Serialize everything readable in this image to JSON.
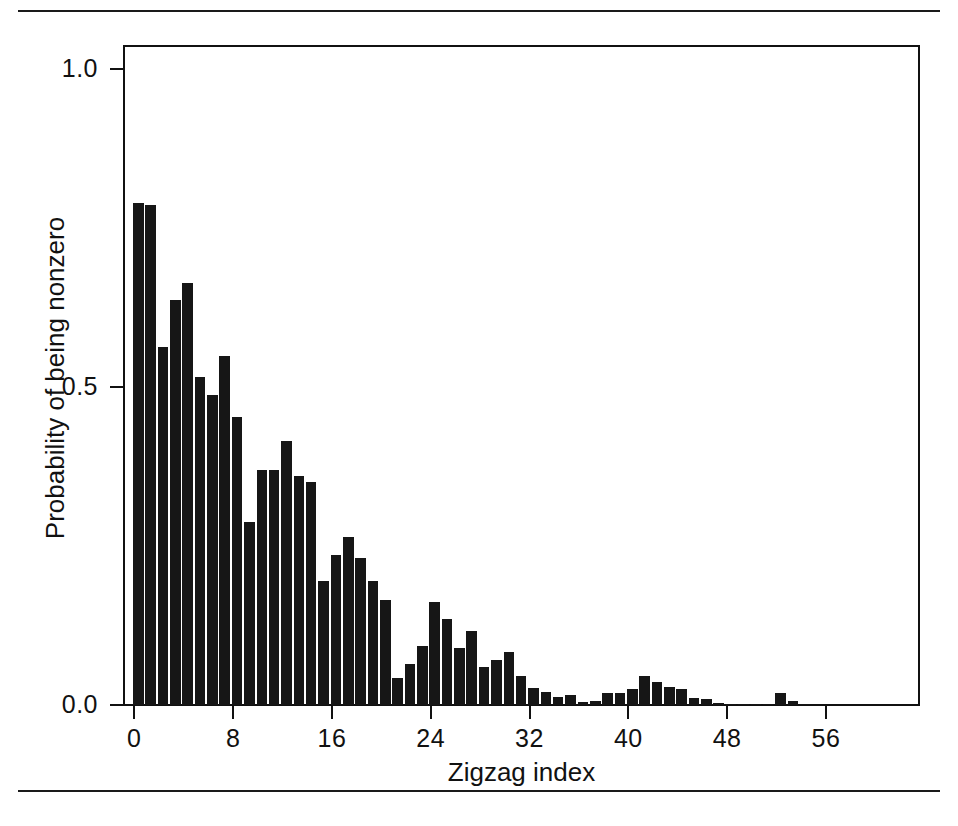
{
  "figure": {
    "background_color": "#ffffff",
    "bar_color": "#161616",
    "axis_color": "#111111",
    "rules": [
      "page-rule-top",
      "page-rule-bottom"
    ]
  },
  "chart_data": {
    "type": "bar",
    "title": "",
    "subtitle": "",
    "xlabel": "Zigzag index",
    "ylabel": "Probability of being nonzero",
    "xlim": [
      -1,
      63
    ],
    "ylim": [
      0.0,
      1.0
    ],
    "grid": false,
    "legend": null,
    "xticks": [
      0,
      8,
      16,
      24,
      32,
      40,
      48,
      56
    ],
    "xtick_labels": [
      "0",
      "8",
      "16",
      "24",
      "32",
      "40",
      "48",
      "56"
    ],
    "yticks": [
      0.0,
      0.5,
      1.0
    ],
    "ytick_labels": [
      "0.0",
      "0.5",
      "1.0"
    ],
    "categories": [
      0,
      1,
      2,
      3,
      4,
      5,
      6,
      7,
      8,
      9,
      10,
      11,
      12,
      13,
      14,
      15,
      16,
      17,
      18,
      19,
      20,
      21,
      22,
      23,
      24,
      25,
      26,
      27,
      28,
      29,
      30,
      31,
      32,
      33,
      34,
      35,
      36,
      37,
      38,
      39,
      40,
      41,
      42,
      43,
      44,
      45,
      46,
      47,
      48,
      49,
      50,
      51,
      52,
      53,
      54,
      55,
      56,
      57,
      58,
      59,
      60,
      61,
      62
    ],
    "values": [
      0.789,
      0.786,
      0.563,
      0.637,
      0.663,
      0.516,
      0.487,
      0.549,
      0.453,
      0.288,
      0.369,
      0.369,
      0.415,
      0.36,
      0.351,
      0.195,
      0.236,
      0.264,
      0.231,
      0.195,
      0.165,
      0.042,
      0.064,
      0.093,
      0.162,
      0.135,
      0.09,
      0.116,
      0.059,
      0.07,
      0.083,
      0.046,
      0.027,
      0.021,
      0.013,
      0.016,
      0.004,
      0.006,
      0.019,
      0.019,
      0.025,
      0.046,
      0.036,
      0.028,
      0.025,
      0.011,
      0.009,
      0.003,
      0.002,
      0.001,
      0.001,
      0.001,
      0.019,
      0.006,
      0.001,
      0.0,
      0.0,
      0.0,
      0.0,
      0.0,
      0.0,
      0.0,
      0.0
    ]
  }
}
